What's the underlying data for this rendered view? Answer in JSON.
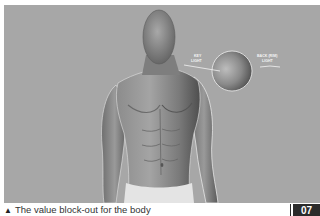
{
  "figure": {
    "alt": "Grey value block-out render of a faceless male torso with a lighting reference sphere",
    "background_color": "#a9a9a9",
    "annotations": {
      "key_light_line1": "KEY",
      "key_light_line2": "LIGHT",
      "back_light_line1": "BACK (RIM)",
      "back_light_line2": "LIGHT"
    }
  },
  "caption": {
    "marker": "▲",
    "text": "The value block-out for the body"
  },
  "page": {
    "number": "07"
  }
}
